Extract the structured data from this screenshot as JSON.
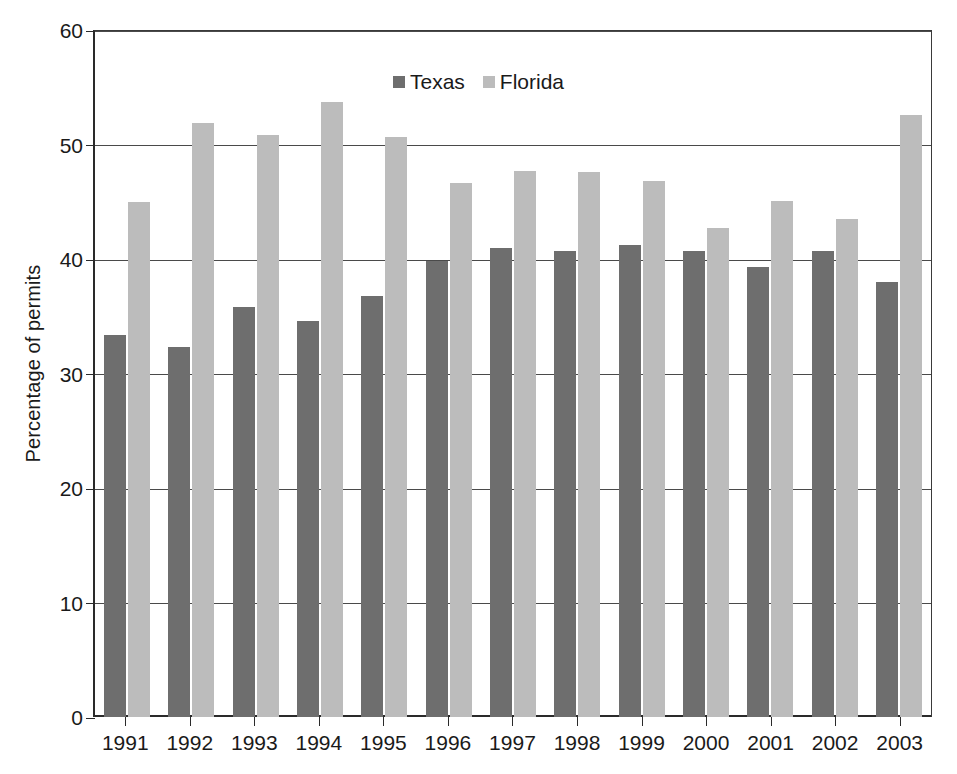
{
  "chart_data": {
    "type": "bar",
    "title": "",
    "xlabel": "",
    "ylabel": "Percentage of permits",
    "ylim": [
      0,
      60
    ],
    "yticks": [
      0,
      10,
      20,
      30,
      40,
      50,
      60
    ],
    "grid": true,
    "legend_position": "top-center",
    "categories": [
      "1991",
      "1992",
      "1993",
      "1994",
      "1995",
      "1996",
      "1997",
      "1998",
      "1999",
      "2000",
      "2001",
      "2002",
      "2003"
    ],
    "series": [
      {
        "name": "Texas",
        "color": "#6e6e6e",
        "values": [
          33.4,
          32.3,
          35.8,
          34.6,
          36.8,
          39.8,
          41.0,
          40.7,
          41.2,
          40.7,
          39.3,
          40.7,
          38.0
        ]
      },
      {
        "name": "Florida",
        "color": "#bcbcbc",
        "values": [
          45.0,
          51.9,
          50.8,
          53.7,
          50.7,
          46.6,
          47.7,
          47.6,
          46.8,
          42.7,
          45.1,
          43.5,
          52.6
        ]
      }
    ]
  },
  "legend": {
    "items": [
      {
        "label": "Texas"
      },
      {
        "label": "Florida"
      }
    ]
  },
  "axes": {
    "y_label": "Percentage of permits",
    "y_ticks": [
      "60",
      "50",
      "40",
      "30",
      "20",
      "10",
      "0"
    ],
    "x_ticks": [
      "1991",
      "1992",
      "1993",
      "1994",
      "1995",
      "1996",
      "1997",
      "1998",
      "1999",
      "2000",
      "2001",
      "2002",
      "2003"
    ]
  }
}
